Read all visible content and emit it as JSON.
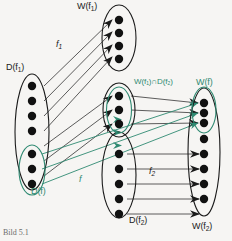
{
  "figure": {
    "caption": "Bild 5.1",
    "colors": {
      "black": "#1a1a1a",
      "green": "#2f8a72",
      "background": "#f6f5f3",
      "arrow_gray": "#4a4a4a"
    },
    "sets": [
      {
        "id": "D_f1",
        "label": "D(f₁)",
        "label_parts": {
          "base": "D(f",
          "sub": "1",
          "tail": ")"
        },
        "dot_count": 7,
        "color": "black",
        "cx": 32,
        "cy": 132,
        "rx": 17,
        "ry": 58
      },
      {
        "id": "D_f",
        "label": "D(f)",
        "label_parts": {
          "base": "D(f",
          "sub": "",
          "tail": ")"
        },
        "dot_count": 3,
        "color": "green",
        "cx": 32,
        "cy": 170,
        "rx": 13,
        "ry": 25
      },
      {
        "id": "W_f1",
        "label": "W(f₁)",
        "label_parts": {
          "base": "W(f",
          "sub": "1",
          "tail": ")"
        },
        "dot_count": 4,
        "color": "black",
        "cx": 119,
        "cy": 38,
        "rx": 17,
        "ry": 33
      },
      {
        "id": "W_f1_cap_D_f2",
        "label": "W(f₁)∩D(f₂)",
        "label_parts": {
          "base": "W(f",
          "sub": "1",
          "tail": ")∩D(f",
          "sub2": "2",
          "tail2": ")"
        },
        "dot_count": 3,
        "color": "green",
        "cx": 119,
        "cy": 110,
        "rx": 13,
        "ry": 23
      },
      {
        "id": "D_f2",
        "label": "D(f₂)",
        "label_parts": {
          "base": "D(f",
          "sub": "2",
          "tail": ")"
        },
        "dot_count": 5,
        "color": "black",
        "cx": 119,
        "cy": 175,
        "rx": 17,
        "ry": 43
      },
      {
        "id": "W_f",
        "label": "W(f)",
        "label_parts": {
          "base": "W(f",
          "sub": "",
          "tail": ")"
        },
        "dot_count": 3,
        "color": "green",
        "cx": 204,
        "cy": 110,
        "rx": 12,
        "ry": 23
      },
      {
        "id": "W_f2",
        "label": "W(f₂)",
        "label_parts": {
          "base": "W(f",
          "sub": "2",
          "tail": ")"
        },
        "dot_count": 8,
        "color": "black",
        "cx": 204,
        "cy": 152,
        "rx": 16,
        "ry": 64
      }
    ],
    "map_labels": [
      {
        "id": "f1",
        "text": "f₁",
        "base": "f",
        "sub": "1",
        "x": 55,
        "y": 44,
        "color": "black"
      },
      {
        "id": "f2",
        "text": "f₂",
        "base": "f",
        "sub": "2",
        "x": 151,
        "y": 170,
        "color": "black"
      },
      {
        "id": "f",
        "text": "f",
        "base": "f",
        "sub": "",
        "x": 79,
        "y": 177,
        "color": "green"
      }
    ],
    "arrow_groups": [
      {
        "id": "f1-arrows",
        "from": "D_f1",
        "to": "W_f1-and-intersection",
        "count": 7,
        "color": "black",
        "style": "up-right-diagonal"
      },
      {
        "id": "f2-arrows",
        "from": "D_f2",
        "to": "W_f2",
        "count": 5,
        "color": "black",
        "style": "horizontal"
      },
      {
        "id": "intersection-arrows",
        "from": "W_f1_cap_D_f2",
        "to": "W_f",
        "count": 3,
        "color": "black",
        "style": "slight-down-right"
      },
      {
        "id": "f-composite-arrows",
        "from": "D_f",
        "to": "W_f",
        "count": 3,
        "color": "green",
        "style": "long-up-right"
      }
    ]
  }
}
